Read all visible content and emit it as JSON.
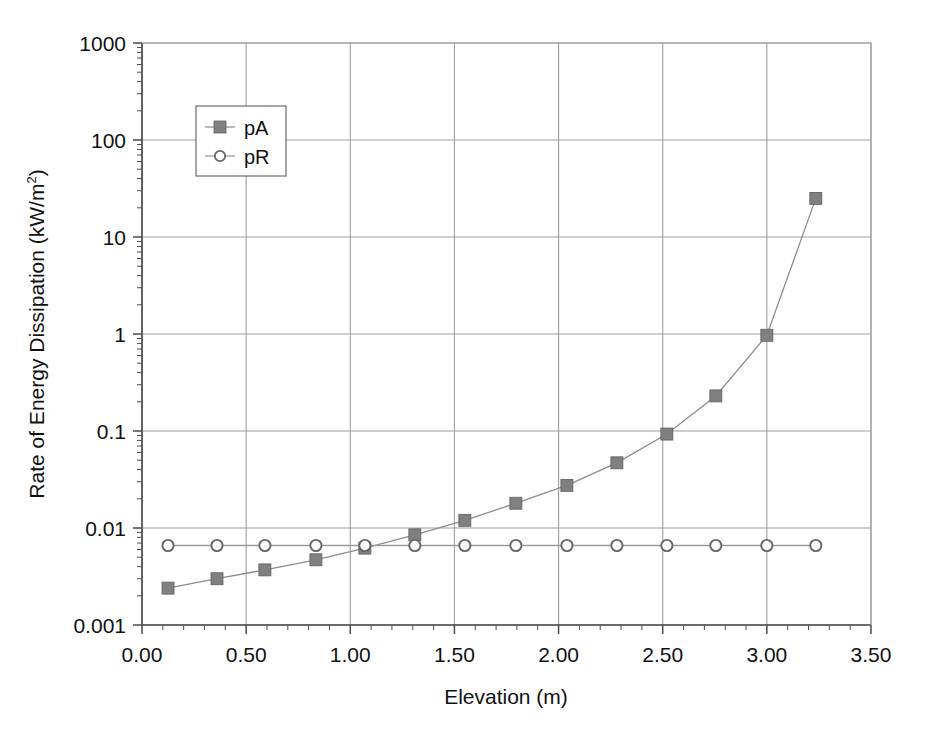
{
  "chart_data": {
    "type": "line",
    "title": "",
    "xlabel": "Elevation (m)",
    "ylabel": "Rate of Energy Dissipation (kW/m",
    "ylabel_sup": "2",
    "ylabel_suffix": ")",
    "xlim": [
      0.0,
      3.5
    ],
    "ylim": [
      0.001,
      1000
    ],
    "yscale": "log",
    "xscale": "linear",
    "grid": true,
    "grid_major_only": true,
    "legend_position": "upper-left-inside",
    "xticks": [
      "0.00",
      "0.50",
      "1.00",
      "1.50",
      "2.00",
      "2.50",
      "3.00",
      "3.50"
    ],
    "xtick_values": [
      0.0,
      0.5,
      1.0,
      1.5,
      2.0,
      2.5,
      3.0,
      3.5
    ],
    "x_minor_tick_step": 0.1,
    "yticks": [
      "0.001",
      "0.01",
      "0.1",
      "1",
      "10",
      "100",
      "1000"
    ],
    "ytick_values": [
      0.001,
      0.01,
      0.1,
      1,
      10,
      100,
      1000
    ],
    "x": [
      0.125,
      0.36,
      0.59,
      0.835,
      1.07,
      1.31,
      1.55,
      1.795,
      2.04,
      2.28,
      2.52,
      2.755,
      3.0,
      3.235
    ],
    "series": [
      {
        "name": "pA",
        "marker": "square",
        "marker_filled": true,
        "color": "#808080",
        "line_color": "#8c8c8c",
        "values": [
          0.0024,
          0.003,
          0.0037,
          0.0047,
          0.0062,
          0.0085,
          0.012,
          0.018,
          0.0275,
          0.047,
          0.093,
          0.23,
          0.97,
          25
        ]
      },
      {
        "name": "pR",
        "marker": "circle",
        "marker_filled": false,
        "color": "#666666",
        "line_color": "#9a9a9a",
        "values": [
          0.0066,
          0.0066,
          0.0066,
          0.0066,
          0.0066,
          0.0066,
          0.0066,
          0.0066,
          0.0066,
          0.0066,
          0.0066,
          0.0066,
          0.0066,
          0.0066
        ]
      }
    ]
  },
  "legend": {
    "entries": [
      {
        "label": "pA"
      },
      {
        "label": "pR"
      }
    ]
  },
  "colors": {
    "series_marker": "#808080",
    "grid": "#9e9e9e",
    "axis": "#4a4a4a",
    "text": "#111111",
    "background": "#ffffff"
  }
}
